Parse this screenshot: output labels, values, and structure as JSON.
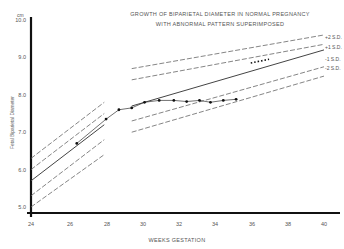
{
  "chart_data": {
    "type": "line",
    "title": "GROWTH OF BIPARIETAL DIAMETER IN NORMAL PREGNANCY",
    "subtitle": "WITH ABNORMAL PATTERN SUPERIMPOSED",
    "xlabel": "WEEKS GESTATION",
    "ylabel": "Fetal Biparietal Diameter",
    "yunit": "cm",
    "xlim": [
      24,
      40
    ],
    "ylim": [
      5.0,
      10.0
    ],
    "x_ticks": [
      "24",
      "26",
      "28",
      "30",
      "32",
      "34",
      "36",
      "38",
      "40"
    ],
    "y_ticks": [
      "5.0",
      "6.0",
      "7.0",
      "8.0",
      "9.0",
      "10.0"
    ],
    "grid": false,
    "legend_position": "right-edge labels",
    "reference_bands": [
      {
        "name": "+2 S.D.",
        "segments": [
          [
            [
              24,
              6.3
            ],
            [
              28,
              7.8
            ]
          ],
          [
            [
              29.5,
              8.7
            ],
            [
              40,
              9.6
            ]
          ]
        ]
      },
      {
        "name": "+1 S.D.",
        "segments": [
          [
            [
              24,
              6.0
            ],
            [
              28,
              7.5
            ]
          ],
          [
            [
              29.5,
              8.4
            ],
            [
              40,
              9.35
            ]
          ]
        ]
      },
      {
        "name": "Mean",
        "segments": [
          [
            [
              24,
              5.7
            ],
            [
              28,
              7.2
            ]
          ],
          [
            [
              29.5,
              7.7
            ],
            [
              40,
              9.2
            ]
          ]
        ]
      },
      {
        "name": "-1 S.D.",
        "segments": [
          [
            [
              24,
              5.3
            ],
            [
              28,
              6.8
            ]
          ],
          [
            [
              29.5,
              7.3
            ],
            [
              40,
              8.75
            ]
          ]
        ]
      },
      {
        "name": "-2 S.D.",
        "segments": [
          [
            [
              24,
              5.0
            ],
            [
              28,
              6.4
            ]
          ],
          [
            [
              29.5,
              7.0
            ],
            [
              40,
              8.5
            ]
          ]
        ]
      }
    ],
    "series": [
      {
        "name": "Abnormal pattern (observed)",
        "x": [
          26.5,
          28.1,
          28.8,
          29.5,
          30.2,
          31.0,
          31.8,
          32.5,
          33.2,
          33.8,
          34.5,
          35.2
        ],
        "y": [
          6.7,
          7.35,
          7.6,
          7.65,
          7.8,
          7.85,
          7.85,
          7.82,
          7.85,
          7.8,
          7.85,
          7.88
        ]
      },
      {
        "name": "Continuation (dotted)",
        "x": [
          36.0,
          37.0
        ],
        "y": [
          8.85,
          8.95
        ]
      }
    ]
  },
  "labels": {
    "title_line1": "GROWTH OF BIPARIETAL DIAMETER IN NORMAL PREGNANCY",
    "title_line2": "WITH ABNORMAL PATTERN SUPERIMPOSED",
    "unit": "cm",
    "xlabel": "WEEKS GESTATION",
    "ylabel": "Fetal Biparietal Diameter",
    "sd_plus2": "+2 S.D.",
    "sd_plus1": "+1 S.D.",
    "sd_minus1": "-1 S.D.",
    "sd_minus2": "-2 S.D.",
    "x_ticks": [
      "24",
      "26",
      "28",
      "30",
      "32",
      "34",
      "36",
      "38",
      "40"
    ],
    "y_ticks": [
      "5.0",
      "6.0",
      "7.0",
      "8.0",
      "9.0",
      "10.0"
    ]
  }
}
